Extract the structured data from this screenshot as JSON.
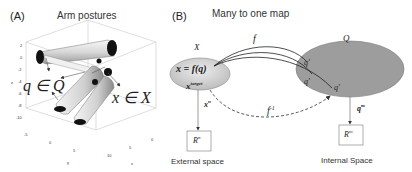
{
  "panel_a": {
    "label": "(A)",
    "title": "Arm postures",
    "annotation_q": "q ∈ Q",
    "annotation_x": "x ∈ X",
    "z_ticks": [
      "2",
      "0",
      "-2",
      "-4",
      "-6",
      "-8",
      "-10"
    ],
    "z_label": "z",
    "y_ticks": [
      "-5",
      "0",
      "5"
    ],
    "y_label": "y",
    "x_ticks": [
      "10",
      "5",
      "0"
    ],
    "x_label": "x"
  },
  "panel_b": {
    "label": "(B)",
    "title": "Many to one map",
    "set_x_label": "X",
    "set_q_label": "Q",
    "map_label": "f",
    "inverse_label": "f",
    "inverse_sup": "-1",
    "x_eq": "x = f(q)",
    "x_target": "x",
    "x_target_sup": "target",
    "x_n_label": "x",
    "x_n_sup": "n",
    "q_prime_1": "q'",
    "q_prime_2": "q'",
    "q_prime_3": "q'",
    "q_m_label": "q",
    "q_m_sup": "m",
    "box_left": "R",
    "box_left_sup": "n",
    "box_right": "R",
    "box_right_sup": "m",
    "caption_left": "External space",
    "caption_right": "Internal Space"
  },
  "colors": {
    "ellipse_x": "#d9d9d9",
    "ellipse_q": "#9a9a9a",
    "arm_light": "#e8e8e8",
    "arm_dark": "#1a1a1a",
    "line": "#333333"
  }
}
